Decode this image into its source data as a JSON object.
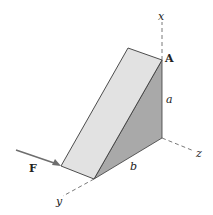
{
  "diagram": {
    "type": "3d-wedge-with-force",
    "labels": {
      "x_axis": "x",
      "y_axis": "y",
      "z_axis": "z",
      "point": "A",
      "height": "a",
      "width": "b",
      "force": "F"
    },
    "colors": {
      "front_face": "#e2e2e2",
      "side_face": "#a9a9a9",
      "edge": "#3a3a3a",
      "force_arrow": "#6e6e6e",
      "axis": "#555555"
    }
  }
}
